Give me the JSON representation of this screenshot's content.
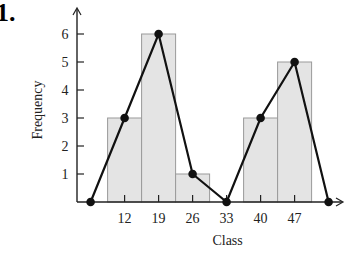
{
  "problem_number": "1.",
  "chart_data": {
    "type": "bar",
    "subtype": "histogram-with-frequency-polygon",
    "title": "",
    "xlabel": "Class",
    "ylabel": "Frequency",
    "categories": [
      "12",
      "19",
      "26",
      "33",
      "40",
      "47"
    ],
    "class_marks": [
      12,
      19,
      26,
      33,
      40,
      47
    ],
    "values": [
      3,
      6,
      1,
      0,
      3,
      5
    ],
    "class_width": 7,
    "polygon": {
      "x": [
        5,
        12,
        19,
        26,
        33,
        40,
        47,
        54
      ],
      "y": [
        0,
        3,
        6,
        1,
        0,
        3,
        5,
        0
      ]
    },
    "yticks": [
      1,
      2,
      3,
      4,
      5,
      6
    ],
    "ylim": [
      0,
      6.6
    ],
    "xlim": [
      2.2,
      57.5
    ],
    "grid": false,
    "legend": "none",
    "colors": {
      "bar_fill": "#e4e4e4",
      "bar_stroke": "#9a9a9a",
      "line": "#111111",
      "axis": "#222222"
    }
  }
}
